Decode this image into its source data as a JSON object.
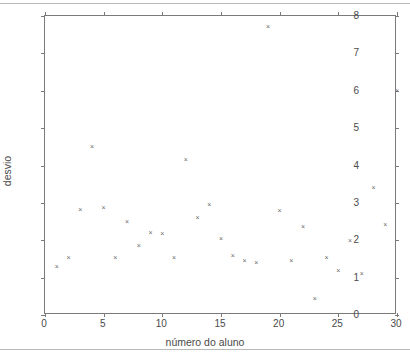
{
  "chart_data": {
    "type": "scatter",
    "title": "",
    "xlabel": "número do aluno",
    "ylabel": "desvio",
    "xlim": [
      0,
      30
    ],
    "ylim": [
      0,
      8
    ],
    "xticks": [
      0,
      5,
      10,
      15,
      20,
      25,
      30
    ],
    "yticks": [
      0,
      1,
      2,
      3,
      4,
      5,
      6,
      7,
      8
    ],
    "xtick_labels": [
      "0",
      "5",
      "10",
      "15",
      "20",
      "25",
      "30"
    ],
    "ytick_labels": [
      "0",
      "1",
      "2",
      "3",
      "4",
      "5",
      "6",
      "7",
      "8"
    ],
    "grid": false,
    "legend": null,
    "marker": "x",
    "marker_color": "#6b6b6b",
    "frame_color": "#7a7a7a",
    "x": [
      1,
      2,
      3,
      4,
      5,
      6,
      7,
      8,
      9,
      10,
      11,
      12,
      13,
      14,
      15,
      16,
      17,
      18,
      19,
      20,
      21,
      22,
      23,
      24,
      25,
      26,
      27,
      28,
      29,
      30
    ],
    "y": [
      1.3,
      1.55,
      2.82,
      4.52,
      2.88,
      1.55,
      2.5,
      1.85,
      2.2,
      2.18,
      1.53,
      4.15,
      2.62,
      2.95,
      2.05,
      1.58,
      1.45,
      1.4,
      7.73,
      2.8,
      1.45,
      2.38,
      0.45,
      1.55,
      1.2,
      2.0,
      1.1,
      3.4,
      2.42,
      6.02
    ]
  },
  "axis": {
    "y_title": "desvio",
    "x_title": "número do aluno"
  }
}
